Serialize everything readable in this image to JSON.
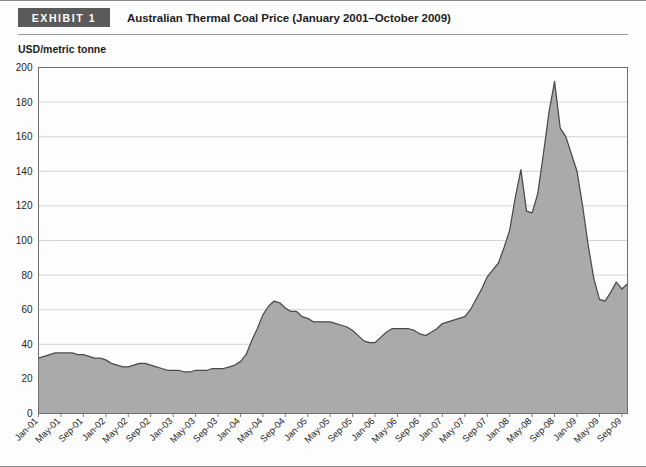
{
  "header": {
    "badge": "EXHIBIT 1",
    "title": "Australian Thermal Coal Price (January 2001–October 2009)"
  },
  "axis_unit_label": "USD/metric tonne",
  "colors": {
    "badge_bg": "#5a5a5a",
    "badge_text": "#ffffff",
    "area_fill": "#aaaaaa",
    "line_stroke": "#4a4a4a",
    "grid": "#cfcfcf",
    "axis": "#6e6e6e",
    "text": "#1d1d1d"
  },
  "chart_data": {
    "type": "area",
    "title": "Australian Thermal Coal Price (January 2001–October 2009)",
    "xlabel": "",
    "ylabel": "USD/metric tonne",
    "ylim": [
      0,
      200
    ],
    "yticks": [
      0,
      20,
      40,
      60,
      80,
      100,
      120,
      140,
      160,
      180,
      200
    ],
    "grid": true,
    "legend": "none",
    "xtick_labels": [
      "Jan-01",
      "May-01",
      "Sep-01",
      "Jan-02",
      "May-02",
      "Sep-02",
      "Jan-03",
      "May-03",
      "Sep-03",
      "Jan-04",
      "May-04",
      "Sep-04",
      "Jan-05",
      "May-05",
      "Sep-05",
      "Jan-06",
      "May-06",
      "Sep-06",
      "Jan-07",
      "May-07",
      "Sep-07",
      "Jan-08",
      "May-08",
      "Sep-08",
      "Jan-09",
      "May-09",
      "Sep-09"
    ],
    "x": [
      "Jan-01",
      "Feb-01",
      "Mar-01",
      "Apr-01",
      "May-01",
      "Jun-01",
      "Jul-01",
      "Aug-01",
      "Sep-01",
      "Oct-01",
      "Nov-01",
      "Dec-01",
      "Jan-02",
      "Feb-02",
      "Mar-02",
      "Apr-02",
      "May-02",
      "Jun-02",
      "Jul-02",
      "Aug-02",
      "Sep-02",
      "Oct-02",
      "Nov-02",
      "Dec-02",
      "Jan-03",
      "Feb-03",
      "Mar-03",
      "Apr-03",
      "May-03",
      "Jun-03",
      "Jul-03",
      "Aug-03",
      "Sep-03",
      "Oct-03",
      "Nov-03",
      "Dec-03",
      "Jan-04",
      "Feb-04",
      "Mar-04",
      "Apr-04",
      "May-04",
      "Jun-04",
      "Jul-04",
      "Aug-04",
      "Sep-04",
      "Oct-04",
      "Nov-04",
      "Dec-04",
      "Jan-05",
      "Feb-05",
      "Mar-05",
      "Apr-05",
      "May-05",
      "Jun-05",
      "Jul-05",
      "Aug-05",
      "Sep-05",
      "Oct-05",
      "Nov-05",
      "Dec-05",
      "Jan-06",
      "Feb-06",
      "Mar-06",
      "Apr-06",
      "May-06",
      "Jun-06",
      "Jul-06",
      "Aug-06",
      "Sep-06",
      "Oct-06",
      "Nov-06",
      "Dec-06",
      "Jan-07",
      "Feb-07",
      "Mar-07",
      "Apr-07",
      "May-07",
      "Jun-07",
      "Jul-07",
      "Aug-07",
      "Sep-07",
      "Oct-07",
      "Nov-07",
      "Dec-07",
      "Jan-08",
      "Feb-08",
      "Mar-08",
      "Apr-08",
      "May-08",
      "Jun-08",
      "Jul-08",
      "Aug-08",
      "Sep-08",
      "Oct-08",
      "Nov-08",
      "Dec-08",
      "Jan-09",
      "Feb-09",
      "Mar-09",
      "Apr-09",
      "May-09",
      "Jun-09",
      "Jul-09",
      "Aug-09",
      "Sep-09",
      "Oct-09"
    ],
    "values": [
      32,
      33,
      34,
      35,
      35,
      35,
      35,
      34,
      34,
      33,
      32,
      32,
      31,
      29,
      28,
      27,
      27,
      28,
      29,
      29,
      28,
      27,
      26,
      25,
      25,
      25,
      24,
      24,
      25,
      25,
      25,
      26,
      26,
      26,
      27,
      28,
      30,
      34,
      42,
      49,
      57,
      62,
      65,
      64,
      61,
      59,
      59,
      56,
      55,
      53,
      53,
      53,
      53,
      52,
      51,
      50,
      48,
      45,
      42,
      41,
      41,
      44,
      47,
      49,
      49,
      49,
      49,
      48,
      46,
      45,
      47,
      49,
      52,
      53,
      54,
      55,
      56,
      60,
      66,
      72,
      79,
      83,
      87,
      96,
      106,
      125,
      141,
      117,
      116,
      127,
      150,
      174,
      192,
      165,
      160,
      150,
      140,
      120,
      97,
      78,
      66,
      65,
      70,
      76,
      72,
      75
    ]
  }
}
